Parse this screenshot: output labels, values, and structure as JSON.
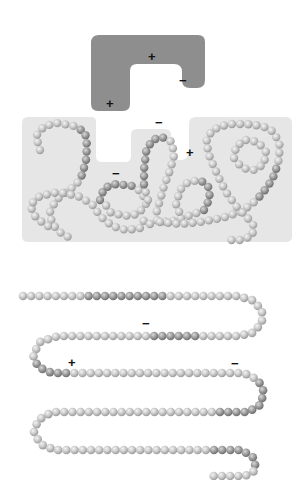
{
  "diagram": {
    "colors": {
      "partner_fill": "#8e8e8e",
      "folded_bg": "#e6e6e6",
      "bead_light": "#c8c8c8",
      "bead_dark": "#9a9a9a",
      "charge_text": "#111111"
    },
    "partner": {
      "label": "binding-partner",
      "charges": [
        {
          "sign": "+",
          "x": 152,
          "y": 57
        },
        {
          "sign": "−",
          "x": 183,
          "y": 81
        },
        {
          "sign": "+",
          "x": 110,
          "y": 104
        }
      ]
    },
    "folded_protein": {
      "label": "folded-protein",
      "charges": [
        {
          "sign": "−",
          "x": 159,
          "y": 123
        },
        {
          "sign": "+",
          "x": 190,
          "y": 153
        },
        {
          "sign": "−",
          "x": 116,
          "y": 174
        }
      ]
    },
    "unfolded_chain": {
      "label": "unfolded-polypeptide",
      "charges": [
        {
          "sign": "−",
          "x": 146,
          "y": 324
        },
        {
          "sign": "+",
          "x": 72,
          "y": 363
        },
        {
          "sign": "−",
          "x": 235,
          "y": 364
        }
      ]
    }
  }
}
